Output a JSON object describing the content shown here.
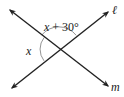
{
  "diagram": {
    "type": "intersecting-lines",
    "width": 124,
    "height": 97,
    "colors": {
      "line": "#222222",
      "arc": "#888888",
      "text": "#222222",
      "background": "#ffffff"
    },
    "intersection": {
      "x": 59,
      "y": 49
    },
    "lines": [
      {
        "id": "l",
        "label": "ℓ",
        "from": {
          "x": 12,
          "y": 88
        },
        "to": {
          "x": 108,
          "y": 12
        },
        "label_pos": {
          "x": 112,
          "y": 14
        }
      },
      {
        "id": "m",
        "label": "m",
        "from": {
          "x": 10,
          "y": 10
        },
        "to": {
          "x": 108,
          "y": 86
        },
        "label_pos": {
          "x": 112,
          "y": 91
        }
      }
    ],
    "angles": [
      {
        "id": "top-angle",
        "label_var": "x",
        "label_rest": " + 30°",
        "full_label": "x + 30°",
        "label_pos": {
          "x": 44,
          "y": 31
        }
      },
      {
        "id": "left-angle",
        "label_var": "x",
        "full_label": "x",
        "label_pos": {
          "x": 26,
          "y": 55
        }
      }
    ]
  }
}
